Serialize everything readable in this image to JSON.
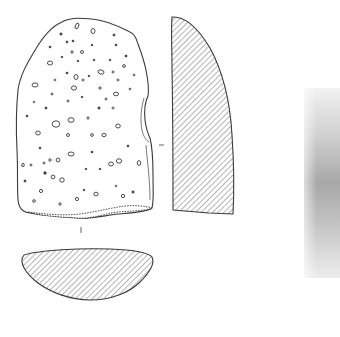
{
  "figure": {
    "type": "archaeological-artifact-drawing",
    "views": [
      {
        "id": "face-view",
        "description": "Stone artifact face with vesicular pits and cortex band at base"
      },
      {
        "id": "side-section",
        "description": "Longitudinal cross-section, hatched"
      },
      {
        "id": "transverse-section",
        "description": "Transverse cross-section, hatched"
      },
      {
        "id": "photo",
        "description": "Greyscale photograph strip, partially visible at right edge"
      }
    ],
    "colors": {
      "ink": "#3a3a3a",
      "hatch": "#5a5a5a",
      "background": "#ffffff",
      "photo_mid": "#a8a8a8"
    },
    "section_markers": {
      "horizontal_tick": "–",
      "vertical_tick": "|"
    }
  }
}
